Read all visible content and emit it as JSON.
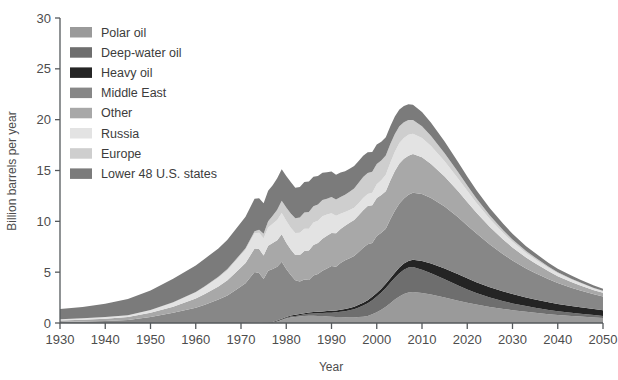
{
  "chart_data": {
    "type": "area",
    "stacked": true,
    "title": "",
    "xlabel": "Year",
    "ylabel": "Billion barrels per year",
    "xlim": [
      1930,
      2050
    ],
    "ylim": [
      0,
      30
    ],
    "xticks": [
      1930,
      1940,
      1950,
      1960,
      1970,
      1980,
      1990,
      2000,
      2010,
      2020,
      2030,
      2040,
      2050
    ],
    "yticks": [
      0,
      5,
      10,
      15,
      20,
      25,
      30
    ],
    "grid": false,
    "legend_position": "top-left",
    "x": [
      1930,
      1935,
      1940,
      1945,
      1950,
      1955,
      1960,
      1962,
      1965,
      1967,
      1969,
      1971,
      1973,
      1974,
      1975,
      1976,
      1977,
      1978,
      1979,
      1980,
      1981,
      1982,
      1983,
      1984,
      1985,
      1986,
      1987,
      1988,
      1989,
      1990,
      1991,
      1992,
      1993,
      1994,
      1995,
      1996,
      1997,
      1998,
      1999,
      2000,
      2001,
      2002,
      2003,
      2004,
      2005,
      2006,
      2007,
      2008,
      2010,
      2012,
      2015,
      2018,
      2020,
      2022,
      2025,
      2028,
      2030,
      2033,
      2035,
      2038,
      2040,
      2043,
      2045,
      2048,
      2050
    ],
    "series": [
      {
        "name": "Lower 48 U.S. states",
        "color": "#7b7b7b",
        "values": [
          1.0,
          1.1,
          1.3,
          1.6,
          1.9,
          2.3,
          2.6,
          2.7,
          2.8,
          2.9,
          3.0,
          3.1,
          3.2,
          3.1,
          3.0,
          3.0,
          3.0,
          3.1,
          3.1,
          3.1,
          3.1,
          3.0,
          3.0,
          3.0,
          3.0,
          2.9,
          2.8,
          2.7,
          2.6,
          2.5,
          2.45,
          2.4,
          2.3,
          2.25,
          2.2,
          2.15,
          2.1,
          2.05,
          1.95,
          1.9,
          1.85,
          1.8,
          1.75,
          1.7,
          1.65,
          1.6,
          1.55,
          1.5,
          1.4,
          1.3,
          1.15,
          1.0,
          0.9,
          0.82,
          0.72,
          0.62,
          0.56,
          0.48,
          0.44,
          0.38,
          0.34,
          0.3,
          0.27,
          0.24,
          0.22
        ]
      },
      {
        "name": "Europe",
        "color": "#cecece",
        "values": [
          0.02,
          0.02,
          0.03,
          0.03,
          0.04,
          0.05,
          0.06,
          0.07,
          0.09,
          0.1,
          0.12,
          0.15,
          0.2,
          0.3,
          0.45,
          0.6,
          0.8,
          1.0,
          1.2,
          1.3,
          1.4,
          1.45,
          1.5,
          1.6,
          1.65,
          1.6,
          1.6,
          1.6,
          1.55,
          1.6,
          1.6,
          1.65,
          1.7,
          1.8,
          1.9,
          2.0,
          2.05,
          2.05,
          2.05,
          2.0,
          1.95,
          1.9,
          1.85,
          1.75,
          1.65,
          1.55,
          1.45,
          1.35,
          1.15,
          1.0,
          0.8,
          0.62,
          0.52,
          0.44,
          0.35,
          0.28,
          0.24,
          0.19,
          0.17,
          0.13,
          0.11,
          0.09,
          0.08,
          0.06,
          0.05
        ]
      },
      {
        "name": "Russia",
        "color": "#e3e3e3",
        "values": [
          0.1,
          0.12,
          0.15,
          0.15,
          0.25,
          0.4,
          0.6,
          0.7,
          0.85,
          1.0,
          1.15,
          1.3,
          1.5,
          1.6,
          1.7,
          1.8,
          1.9,
          2.0,
          2.1,
          2.15,
          2.15,
          2.15,
          2.2,
          2.2,
          2.15,
          2.2,
          2.2,
          2.2,
          2.1,
          1.95,
          1.7,
          1.5,
          1.35,
          1.25,
          1.2,
          1.2,
          1.2,
          1.2,
          1.25,
          1.35,
          1.45,
          1.6,
          1.75,
          1.9,
          2.0,
          2.05,
          2.05,
          2.0,
          1.9,
          1.75,
          1.5,
          1.25,
          1.1,
          0.95,
          0.78,
          0.63,
          0.55,
          0.45,
          0.4,
          0.32,
          0.28,
          0.23,
          0.2,
          0.16,
          0.14
        ]
      },
      {
        "name": "Other",
        "color": "#a8a8a8",
        "values": [
          0.15,
          0.18,
          0.22,
          0.28,
          0.4,
          0.6,
          0.9,
          1.05,
          1.3,
          1.5,
          1.75,
          2.0,
          2.3,
          2.35,
          2.3,
          2.45,
          2.55,
          2.6,
          2.7,
          2.6,
          2.5,
          2.5,
          2.6,
          2.8,
          2.9,
          3.0,
          3.05,
          3.15,
          3.2,
          3.25,
          3.3,
          3.35,
          3.4,
          3.5,
          3.55,
          3.6,
          3.7,
          3.75,
          3.7,
          3.75,
          3.7,
          3.7,
          3.8,
          3.9,
          3.95,
          3.9,
          3.85,
          3.8,
          3.6,
          3.35,
          2.95,
          2.55,
          2.3,
          2.05,
          1.72,
          1.45,
          1.28,
          1.07,
          0.95,
          0.78,
          0.68,
          0.57,
          0.5,
          0.41,
          0.36
        ]
      },
      {
        "name": "Middle East",
        "color": "#878787",
        "values": [
          0.1,
          0.15,
          0.2,
          0.3,
          0.6,
          1.0,
          1.5,
          1.8,
          2.3,
          2.7,
          3.3,
          3.9,
          5.0,
          4.9,
          4.3,
          5.1,
          5.2,
          5.3,
          5.6,
          4.7,
          4.0,
          3.4,
          3.2,
          3.3,
          3.2,
          3.6,
          3.7,
          4.0,
          4.2,
          4.4,
          4.3,
          4.6,
          4.8,
          4.9,
          5.0,
          5.2,
          5.4,
          5.5,
          5.3,
          5.6,
          5.5,
          5.4,
          5.8,
          6.1,
          6.3,
          6.4,
          6.5,
          6.6,
          6.6,
          6.45,
          6.1,
          5.6,
          5.2,
          4.8,
          4.2,
          3.65,
          3.3,
          2.85,
          2.6,
          2.25,
          2.05,
          1.8,
          1.65,
          1.45,
          1.35
        ]
      },
      {
        "name": "Heavy oil",
        "color": "#242424",
        "values": [
          0.0,
          0.0,
          0.0,
          0.0,
          0.0,
          0.0,
          0.0,
          0.0,
          0.0,
          0.0,
          0.0,
          0.0,
          0.02,
          0.03,
          0.04,
          0.05,
          0.06,
          0.07,
          0.08,
          0.09,
          0.1,
          0.1,
          0.11,
          0.12,
          0.13,
          0.14,
          0.15,
          0.16,
          0.17,
          0.18,
          0.19,
          0.2,
          0.21,
          0.22,
          0.24,
          0.26,
          0.28,
          0.3,
          0.32,
          0.35,
          0.38,
          0.42,
          0.46,
          0.5,
          0.55,
          0.6,
          0.66,
          0.72,
          0.85,
          0.95,
          1.05,
          1.1,
          1.1,
          1.08,
          1.02,
          0.96,
          0.92,
          0.86,
          0.82,
          0.76,
          0.72,
          0.67,
          0.64,
          0.59,
          0.56
        ]
      },
      {
        "name": "Deep-water oil",
        "color": "#6e6e6e",
        "values": [
          0.0,
          0.0,
          0.0,
          0.0,
          0.0,
          0.0,
          0.0,
          0.0,
          0.0,
          0.0,
          0.0,
          0.0,
          0.0,
          0.0,
          0.0,
          0.0,
          0.0,
          0.02,
          0.04,
          0.06,
          0.08,
          0.1,
          0.12,
          0.15,
          0.18,
          0.22,
          0.26,
          0.3,
          0.35,
          0.4,
          0.45,
          0.52,
          0.6,
          0.7,
          0.8,
          0.95,
          1.1,
          1.25,
          1.4,
          1.55,
          1.7,
          1.85,
          2.0,
          2.15,
          2.3,
          2.4,
          2.45,
          2.45,
          2.3,
          2.1,
          1.8,
          1.5,
          1.3,
          1.12,
          0.92,
          0.76,
          0.67,
          0.56,
          0.5,
          0.42,
          0.37,
          0.31,
          0.28,
          0.23,
          0.2
        ]
      },
      {
        "name": "Polar oil",
        "color": "#9a9a9a",
        "values": [
          0.0,
          0.0,
          0.0,
          0.0,
          0.0,
          0.0,
          0.0,
          0.0,
          0.0,
          0.0,
          0.0,
          0.0,
          0.0,
          0.0,
          0.0,
          0.0,
          0.05,
          0.15,
          0.3,
          0.45,
          0.55,
          0.6,
          0.65,
          0.7,
          0.72,
          0.72,
          0.7,
          0.68,
          0.65,
          0.62,
          0.6,
          0.58,
          0.56,
          0.55,
          0.55,
          0.58,
          0.62,
          0.7,
          0.85,
          1.05,
          1.3,
          1.6,
          1.95,
          2.3,
          2.6,
          2.85,
          3.0,
          3.05,
          2.95,
          2.8,
          2.5,
          2.2,
          2.0,
          1.82,
          1.58,
          1.38,
          1.26,
          1.1,
          1.0,
          0.87,
          0.79,
          0.69,
          0.63,
          0.55,
          0.5
        ]
      }
    ]
  },
  "legend": {
    "items": [
      {
        "label": "Polar oil",
        "color": "#9a9a9a"
      },
      {
        "label": "Deep-water oil",
        "color": "#6e6e6e"
      },
      {
        "label": "Heavy oil",
        "color": "#242424"
      },
      {
        "label": "Middle East",
        "color": "#878787"
      },
      {
        "label": "Other",
        "color": "#a8a8a8"
      },
      {
        "label": "Russia",
        "color": "#e3e3e3"
      },
      {
        "label": "Europe",
        "color": "#cecece"
      },
      {
        "label": "Lower 48 U.S. states",
        "color": "#7b7b7b"
      }
    ]
  },
  "axes": {
    "x_title": "Year",
    "y_title": "Billion barrels per year",
    "x_tick_labels": [
      "1930",
      "1940",
      "1950",
      "1960",
      "1970",
      "1980",
      "1990",
      "2000",
      "2010",
      "2020",
      "2030",
      "2040",
      "2050"
    ],
    "y_tick_labels": [
      "0",
      "5",
      "10",
      "15",
      "20",
      "25",
      "30"
    ]
  }
}
